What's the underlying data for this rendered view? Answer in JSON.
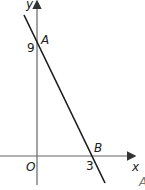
{
  "diagram": {
    "type": "coordinate-graph",
    "axes": {
      "x_label": "x",
      "y_label": "y",
      "origin_label": "O"
    },
    "line": {
      "description": "straight line with negative gradient through A and B",
      "points": [
        {
          "name": "A",
          "x": 0,
          "y": 9,
          "label": "A",
          "tick_label": "9"
        },
        {
          "name": "B",
          "x": 3,
          "y": 0,
          "label": "B",
          "tick_label": "3"
        }
      ]
    },
    "edge_fragment": "A",
    "colors": {
      "line": "#1a1a1a",
      "axis": "#555555",
      "background": "#ffffff"
    }
  }
}
